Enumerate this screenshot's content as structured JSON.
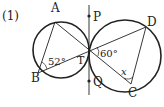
{
  "problem": {
    "number": "(1)"
  },
  "points": {
    "A": {
      "label": "A",
      "x": 55,
      "y": 13
    },
    "B": {
      "label": "B",
      "x": 38,
      "y": 77
    },
    "T": {
      "label": "T",
      "x": 89,
      "y": 50
    },
    "P": {
      "label": "P",
      "x": 89,
      "y": 17
    },
    "Q": {
      "label": "Q",
      "x": 89,
      "y": 81
    },
    "D": {
      "label": "D",
      "x": 148,
      "y": 25
    },
    "C": {
      "label": "C",
      "x": 131,
      "y": 86
    }
  },
  "angles": {
    "angle_B": "52°",
    "angle_T": "60°",
    "angle_C": "x"
  },
  "colors": {
    "stroke": "#222222",
    "background": "#ffffff"
  }
}
